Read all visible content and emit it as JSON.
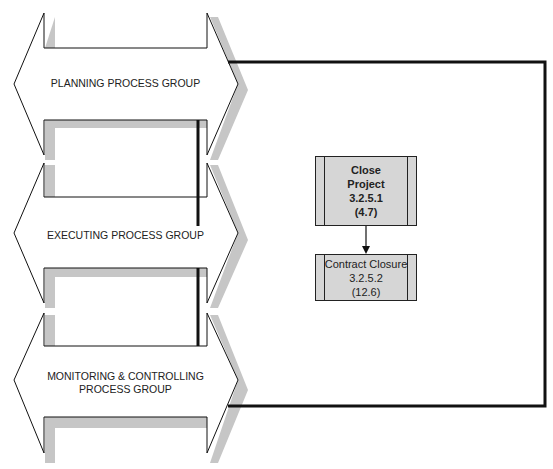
{
  "diagram": {
    "process_groups": [
      {
        "id": "planning",
        "label": "PLANNING PROCESS GROUP"
      },
      {
        "id": "executing",
        "label": "EXECUTING PROCESS GROUP"
      },
      {
        "id": "monitoring",
        "label_line1": "MONITORING & CONTROLLING",
        "label_line2": "PROCESS GROUP"
      }
    ],
    "processes": [
      {
        "name_line1": "Close",
        "name_line2": "Project",
        "section": "3.2.5.1",
        "ref": "(4.7)",
        "style": "bold"
      },
      {
        "name": "Contract Closure",
        "section": "3.2.5.2",
        "ref": "(12.6)",
        "style": "normal"
      }
    ],
    "colors": {
      "box_fill": "#d6d6d6",
      "shadow": "#c4c4c4",
      "line": "#111111"
    }
  }
}
